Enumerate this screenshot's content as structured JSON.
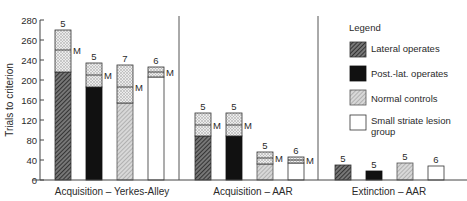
{
  "chart_data": {
    "type": "bar",
    "subtype": "stacked-range-with-median",
    "ylabel": "Trials to criterion",
    "yticks": [
      0,
      40,
      80,
      120,
      160,
      200,
      240,
      260,
      280
    ],
    "ylim": [
      0,
      280
    ],
    "grid": false,
    "legend_position": "upper-right",
    "legend": {
      "title": "Legend",
      "entries": [
        {
          "name": "Lateral operates",
          "pattern": "dense-hatch"
        },
        {
          "name": "Post.-lat. operates",
          "pattern": "solid-black"
        },
        {
          "name": "Normal controls",
          "pattern": "light-hatch"
        },
        {
          "name": "Small striate lesion",
          "name_line2": "group",
          "pattern": "white"
        }
      ]
    },
    "groups": [
      {
        "label": "Acquisition – Yerkes-Alley",
        "bars": [
          {
            "series": "Lateral operates",
            "n": "5",
            "min": 216,
            "median": 250,
            "max": 270
          },
          {
            "series": "Post.-lat. operates",
            "n": "5",
            "min": 186,
            "median": 210,
            "max": 234
          },
          {
            "series": "Normal controls",
            "n": "7",
            "min": 154,
            "median": 186,
            "max": 230
          },
          {
            "series": "Small striate lesion group",
            "n": "6",
            "min": 206,
            "median": 216,
            "max": 226
          }
        ]
      },
      {
        "label": "Acquisition – AAR",
        "bars": [
          {
            "series": "Lateral operates",
            "n": "5",
            "min": 88,
            "median": 110,
            "max": 134
          },
          {
            "series": "Post.-lat. operates",
            "n": "5",
            "min": 88,
            "median": 110,
            "max": 134
          },
          {
            "series": "Normal controls",
            "n": "5",
            "min": 32,
            "median": 44,
            "max": 56
          },
          {
            "series": "Small striate lesion group",
            "n": "6",
            "min": 34,
            "median": 40,
            "max": 46
          }
        ]
      },
      {
        "label": "Extinction – AAR",
        "bars": [
          {
            "series": "Lateral operates",
            "n": "5",
            "value": 30
          },
          {
            "series": "Post.-lat. operates",
            "n": "5",
            "value": 18
          },
          {
            "series": "Normal controls",
            "n": "5",
            "value": 34
          },
          {
            "series": "Small striate lesion group",
            "n": "6",
            "value": 28
          }
        ]
      }
    ],
    "median_marker": "M"
  }
}
